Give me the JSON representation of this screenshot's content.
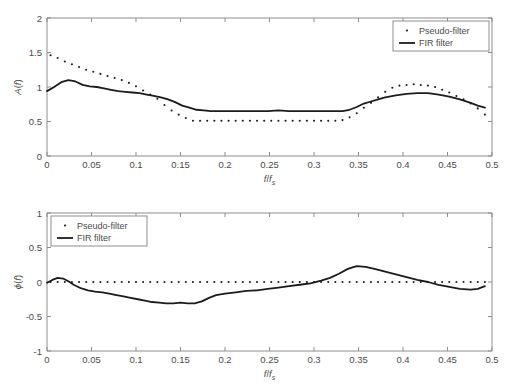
{
  "figure": {
    "background": "#ffffff",
    "line_color": "#1b1b1b",
    "axis_color": "#8d8d8d",
    "panel_count": 2
  },
  "chart_data": [
    {
      "id": "magnitude-response",
      "type": "line",
      "title": "",
      "xlabel": "f/f_s",
      "xlabel_parts": {
        "num": "f",
        "den": "f",
        "sub": "s"
      },
      "ylabel": "A(f)",
      "ylabel_parts": {
        "fn": "A",
        "arg": "f"
      },
      "xlim": [
        0,
        0.5
      ],
      "ylim": [
        0,
        2
      ],
      "xticks": [
        0,
        0.05,
        0.1,
        0.15,
        0.2,
        0.25,
        0.3,
        0.35,
        0.4,
        0.45,
        0.5
      ],
      "xticklabels": [
        "0",
        "0.05",
        "0.1",
        "0.15",
        "0.2",
        "0.25",
        "0.3",
        "0.35",
        "0.4",
        "0.45",
        "0.5"
      ],
      "yticks": [
        0,
        0.5,
        1,
        1.5,
        2
      ],
      "yticklabels": [
        "0",
        "0.5",
        "1",
        "1.5",
        "2"
      ],
      "grid": false,
      "legend_position": "upper right",
      "legend": [
        "Pseudo-filter",
        "FIR filter"
      ],
      "series": [
        {
          "name": "Pseudo-filter",
          "style": "dotted",
          "marker": "dot",
          "x": [
            0.004,
            0.012,
            0.02,
            0.028,
            0.036,
            0.044,
            0.052,
            0.06,
            0.068,
            0.076,
            0.084,
            0.092,
            0.1,
            0.108,
            0.116,
            0.124,
            0.132,
            0.14,
            0.148,
            0.156,
            0.164,
            0.172,
            0.18,
            0.188,
            0.196,
            0.204,
            0.212,
            0.22,
            0.228,
            0.236,
            0.244,
            0.252,
            0.26,
            0.268,
            0.276,
            0.284,
            0.292,
            0.3,
            0.308,
            0.316,
            0.324,
            0.332,
            0.34,
            0.348,
            0.356,
            0.364,
            0.372,
            0.38,
            0.388,
            0.396,
            0.404,
            0.412,
            0.42,
            0.428,
            0.436,
            0.444,
            0.452,
            0.46,
            0.468,
            0.476,
            0.484,
            0.492
          ],
          "y": [
            1.46,
            1.42,
            1.37,
            1.33,
            1.29,
            1.25,
            1.22,
            1.19,
            1.16,
            1.13,
            1.1,
            1.06,
            1.01,
            0.95,
            0.89,
            0.83,
            0.74,
            0.66,
            0.6,
            0.55,
            0.51,
            0.51,
            0.51,
            0.51,
            0.51,
            0.51,
            0.51,
            0.51,
            0.51,
            0.51,
            0.51,
            0.51,
            0.51,
            0.51,
            0.51,
            0.51,
            0.51,
            0.51,
            0.51,
            0.51,
            0.51,
            0.52,
            0.56,
            0.62,
            0.7,
            0.77,
            0.85,
            0.93,
            0.99,
            1.02,
            1.03,
            1.04,
            1.03,
            1.02,
            1.0,
            0.96,
            0.92,
            0.87,
            0.82,
            0.76,
            0.69,
            0.6
          ]
        },
        {
          "name": "FIR filter",
          "style": "solid",
          "x": [
            0.0,
            0.008,
            0.016,
            0.024,
            0.032,
            0.04,
            0.048,
            0.056,
            0.064,
            0.072,
            0.08,
            0.088,
            0.096,
            0.104,
            0.112,
            0.12,
            0.128,
            0.136,
            0.144,
            0.152,
            0.16,
            0.168,
            0.176,
            0.184,
            0.192,
            0.2,
            0.212,
            0.224,
            0.236,
            0.248,
            0.26,
            0.272,
            0.284,
            0.296,
            0.308,
            0.32,
            0.332,
            0.34,
            0.348,
            0.356,
            0.364,
            0.372,
            0.38,
            0.392,
            0.404,
            0.416,
            0.428,
            0.44,
            0.452,
            0.464,
            0.476,
            0.484,
            0.492
          ],
          "y": [
            0.94,
            1.0,
            1.07,
            1.1,
            1.08,
            1.03,
            1.01,
            1.0,
            0.98,
            0.96,
            0.94,
            0.93,
            0.92,
            0.91,
            0.89,
            0.87,
            0.85,
            0.82,
            0.78,
            0.73,
            0.7,
            0.67,
            0.66,
            0.65,
            0.65,
            0.65,
            0.65,
            0.65,
            0.65,
            0.65,
            0.66,
            0.65,
            0.65,
            0.65,
            0.65,
            0.65,
            0.65,
            0.67,
            0.71,
            0.76,
            0.79,
            0.82,
            0.85,
            0.88,
            0.9,
            0.91,
            0.91,
            0.89,
            0.86,
            0.82,
            0.77,
            0.73,
            0.7
          ]
        }
      ]
    },
    {
      "id": "phase-response",
      "type": "line",
      "title": "",
      "xlabel": "f/f_s",
      "xlabel_parts": {
        "num": "f",
        "den": "f",
        "sub": "s"
      },
      "ylabel": "phi(f)",
      "ylabel_parts": {
        "fn": "ϕ",
        "arg": "f"
      },
      "xlim": [
        0,
        0.5
      ],
      "ylim": [
        -1,
        1
      ],
      "xticks": [
        0,
        0.05,
        0.1,
        0.15,
        0.2,
        0.25,
        0.3,
        0.35,
        0.4,
        0.45,
        0.5
      ],
      "xticklabels": [
        "0",
        "0.05",
        "0.1",
        "0.15",
        "0.2",
        "0.25",
        "0.3",
        "0.35",
        "0.4",
        "0.45",
        "0.5"
      ],
      "yticks": [
        -1,
        -0.5,
        0,
        0.5,
        1
      ],
      "yticklabels": [
        "-1",
        "-0.5",
        "0",
        "0.5",
        "1"
      ],
      "grid": false,
      "legend_position": "upper left",
      "legend": [
        "Pseudo-filter",
        "FIR filter"
      ],
      "series": [
        {
          "name": "Pseudo-filter",
          "style": "dotted",
          "marker": "dot",
          "x": [
            0.004,
            0.012,
            0.02,
            0.028,
            0.036,
            0.044,
            0.052,
            0.06,
            0.068,
            0.076,
            0.084,
            0.092,
            0.1,
            0.108,
            0.116,
            0.124,
            0.132,
            0.14,
            0.148,
            0.156,
            0.164,
            0.172,
            0.18,
            0.188,
            0.196,
            0.204,
            0.212,
            0.22,
            0.228,
            0.236,
            0.244,
            0.252,
            0.26,
            0.268,
            0.276,
            0.284,
            0.292,
            0.3,
            0.308,
            0.316,
            0.324,
            0.332,
            0.34,
            0.348,
            0.356,
            0.364,
            0.372,
            0.38,
            0.388,
            0.396,
            0.404,
            0.412,
            0.42,
            0.428,
            0.436,
            0.444,
            0.452,
            0.46,
            0.468,
            0.476,
            0.484,
            0.492
          ],
          "y": [
            0,
            0,
            0,
            0,
            0,
            0,
            0,
            0,
            0,
            0,
            0,
            0,
            0,
            0,
            0,
            0,
            0,
            0,
            0,
            0,
            0,
            0,
            0,
            0,
            0,
            0,
            0,
            0,
            0,
            0,
            0,
            0,
            0,
            0,
            0,
            0,
            0,
            0,
            0,
            0,
            0,
            0,
            0,
            0,
            0,
            0,
            0,
            0,
            0,
            0,
            0,
            0,
            0,
            0,
            0,
            0,
            0,
            0,
            0,
            0,
            0,
            0
          ]
        },
        {
          "name": "FIR filter",
          "style": "solid",
          "x": [
            0.0,
            0.006,
            0.012,
            0.018,
            0.024,
            0.03,
            0.038,
            0.046,
            0.054,
            0.062,
            0.07,
            0.078,
            0.086,
            0.094,
            0.102,
            0.11,
            0.118,
            0.126,
            0.134,
            0.142,
            0.15,
            0.158,
            0.166,
            0.174,
            0.182,
            0.19,
            0.2,
            0.212,
            0.224,
            0.236,
            0.248,
            0.26,
            0.272,
            0.284,
            0.296,
            0.308,
            0.318,
            0.328,
            0.338,
            0.348,
            0.358,
            0.368,
            0.38,
            0.392,
            0.404,
            0.416,
            0.428,
            0.44,
            0.452,
            0.464,
            0.476,
            0.484,
            0.492
          ],
          "y": [
            -0.01,
            0.03,
            0.06,
            0.05,
            0.01,
            -0.04,
            -0.09,
            -0.12,
            -0.14,
            -0.15,
            -0.17,
            -0.19,
            -0.21,
            -0.23,
            -0.25,
            -0.27,
            -0.29,
            -0.3,
            -0.31,
            -0.31,
            -0.3,
            -0.31,
            -0.31,
            -0.28,
            -0.23,
            -0.19,
            -0.17,
            -0.15,
            -0.13,
            -0.12,
            -0.1,
            -0.08,
            -0.06,
            -0.04,
            -0.02,
            0.02,
            0.06,
            0.12,
            0.19,
            0.23,
            0.22,
            0.19,
            0.15,
            0.11,
            0.07,
            0.03,
            0.0,
            -0.04,
            -0.07,
            -0.1,
            -0.11,
            -0.1,
            -0.06
          ]
        }
      ]
    }
  ]
}
